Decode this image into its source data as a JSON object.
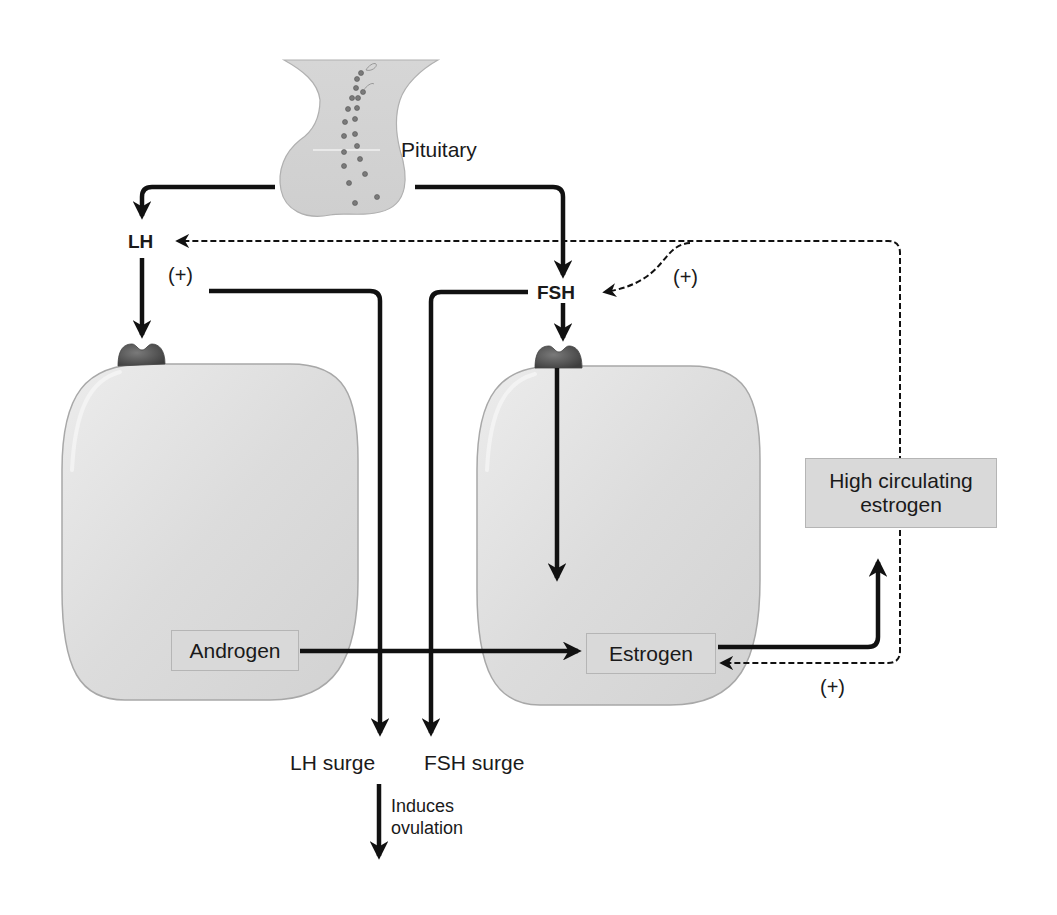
{
  "diagram": {
    "type": "hormone feedback pathway",
    "colors": {
      "cell_fill": "#dcdcdc",
      "cell_stroke": "#a8a8a8",
      "receptor": "#5a5a5a",
      "arrow": "#111111",
      "label_box": "#d9d9d9",
      "pituitary_fill": "#d4d4d4",
      "granule": "#7a7a7a"
    },
    "nodes": {
      "pituitary": {
        "label": "Pituitary"
      },
      "lh": {
        "label": "LH"
      },
      "fsh": {
        "label": "FSH"
      },
      "androgen": {
        "label": "Androgen"
      },
      "estrogen": {
        "label": "Estrogen"
      },
      "high_estrogen": {
        "label": "High circulating estrogen"
      },
      "lh_surge": {
        "label": "LH surge"
      },
      "fsh_surge": {
        "label": "FSH surge"
      }
    },
    "annotations": {
      "plus_lh": "(+)",
      "plus_fsh": "(+)",
      "plus_estrogen": "(+)",
      "induces_line1": "Induces",
      "induces_line2": "ovulation"
    },
    "cells": [
      {
        "id": "left-cell",
        "receptor_ligand": "LH",
        "contains": "Androgen"
      },
      {
        "id": "right-cell",
        "receptor_ligand": "FSH",
        "contains": "Estrogen"
      }
    ],
    "edges": [
      {
        "from": "Pituitary",
        "to": "LH",
        "style": "solid"
      },
      {
        "from": "Pituitary",
        "to": "FSH",
        "style": "solid"
      },
      {
        "from": "LH",
        "to": "left-cell receptor",
        "style": "solid"
      },
      {
        "from": "FSH",
        "to": "right-cell receptor",
        "style": "solid"
      },
      {
        "from": "right-cell receptor",
        "to": "Estrogen",
        "style": "solid"
      },
      {
        "from": "Androgen",
        "to": "Estrogen",
        "style": "solid"
      },
      {
        "from": "Estrogen",
        "to": "High circulating estrogen",
        "style": "solid"
      },
      {
        "from": "High circulating estrogen",
        "to": "LH",
        "style": "dashed",
        "label": "(+)"
      },
      {
        "from": "High circulating estrogen",
        "to": "FSH",
        "style": "dashed",
        "label": "(+)"
      },
      {
        "from": "High circulating estrogen",
        "to": "Estrogen",
        "style": "dashed",
        "label": "(+)"
      },
      {
        "from": "LH",
        "to": "LH surge",
        "style": "solid"
      },
      {
        "from": "FSH",
        "to": "FSH surge",
        "style": "solid"
      },
      {
        "from": "LH surge",
        "to": "ovulation",
        "style": "solid",
        "label": "Induces ovulation"
      }
    ]
  }
}
